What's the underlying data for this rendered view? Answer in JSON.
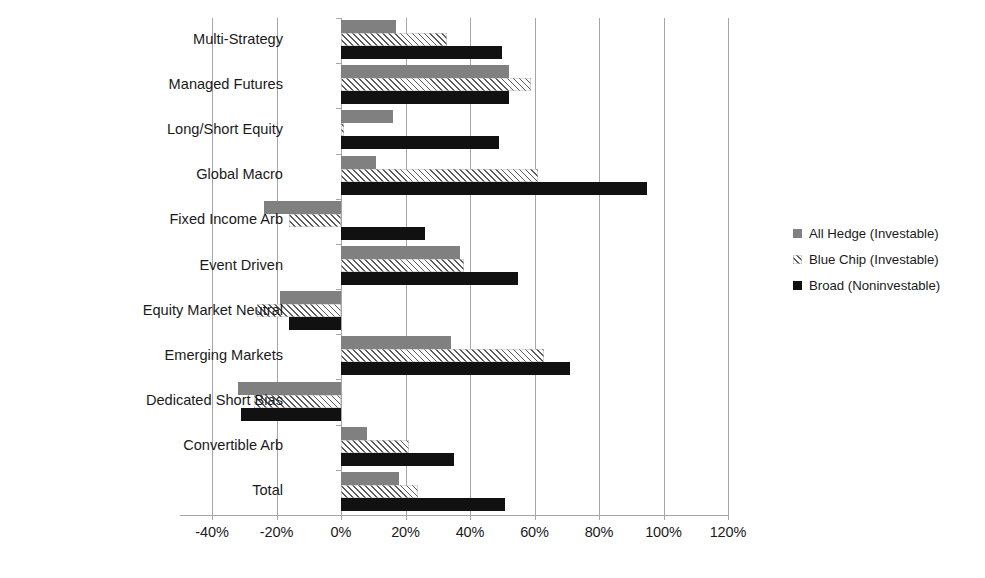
{
  "chart_data": {
    "type": "bar",
    "orientation": "horizontal",
    "title": "",
    "xlabel": "",
    "ylabel": "",
    "xlim": [
      -40,
      120
    ],
    "xtick_step": 20,
    "xtick_labels": [
      "-40%",
      "-20%",
      "0%",
      "20%",
      "40%",
      "60%",
      "80%",
      "100%",
      "120%"
    ],
    "xtick_values": [
      -40,
      -20,
      0,
      20,
      40,
      60,
      80,
      100,
      120
    ],
    "grid": true,
    "legend_position": "right",
    "categories": [
      "Multi-Strategy",
      "Managed Futures",
      "Long/Short Equity",
      "Global Macro",
      "Fixed Income Arb",
      "Event Driven",
      "Equity Market Neutral",
      "Emerging Markets",
      "Dedicated Short Bias",
      "Convertible Arb",
      "Total"
    ],
    "series": [
      {
        "name": "All Hedge (Investable)",
        "color": "#808080",
        "pattern": "solid",
        "values": [
          17,
          52,
          16,
          11,
          -24,
          37,
          -19,
          34,
          -32,
          8,
          18
        ]
      },
      {
        "name": "Blue Chip (Investable)",
        "color": "#5a5a5a",
        "pattern": "diagonal-hatch",
        "values": [
          33,
          59,
          1,
          61,
          -16,
          38,
          -26,
          63,
          -27,
          21,
          24
        ]
      },
      {
        "name": "Broad (Noninvestable)",
        "color": "#111111",
        "pattern": "solid",
        "values": [
          50,
          52,
          49,
          95,
          26,
          55,
          -16,
          71,
          -31,
          35,
          51
        ]
      }
    ]
  },
  "legend": {
    "items": [
      {
        "label": "All Hedge (Investable)",
        "swatch": "solid-gray"
      },
      {
        "label": "Blue Chip (Investable)",
        "swatch": "hatched-gray"
      },
      {
        "label": "Broad (Noninvestable)",
        "swatch": "solid-black"
      }
    ]
  }
}
